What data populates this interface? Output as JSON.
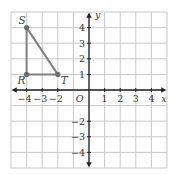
{
  "diagram": {
    "type": "coordinate-grid",
    "x_range": [
      -5,
      5
    ],
    "y_range": [
      -5,
      5
    ],
    "axes": {
      "x_label": "x",
      "y_label": "y",
      "origin_label": "O",
      "x_ticks": [
        {
          "value": -4,
          "label": "−4"
        },
        {
          "value": -3,
          "label": "−3"
        },
        {
          "value": -2,
          "label": "−2"
        },
        {
          "value": 1,
          "label": "1"
        },
        {
          "value": 2,
          "label": "2"
        },
        {
          "value": 3,
          "label": "3"
        },
        {
          "value": 4,
          "label": "4"
        }
      ],
      "y_ticks": [
        {
          "value": 4,
          "label": "4"
        },
        {
          "value": 3,
          "label": "3"
        },
        {
          "value": 2,
          "label": "2"
        },
        {
          "value": 1,
          "label": "1"
        },
        {
          "value": -2,
          "label": "−2"
        },
        {
          "value": -3,
          "label": "−3"
        },
        {
          "value": -4,
          "label": "−4"
        }
      ]
    },
    "triangle": {
      "vertices": [
        {
          "name": "S",
          "x": -4,
          "y": 4
        },
        {
          "name": "R",
          "x": -4,
          "y": 1
        },
        {
          "name": "T",
          "x": -2,
          "y": 1
        }
      ]
    },
    "colors": {
      "grid": "#c8c8c8",
      "axis": "#222222",
      "shape": "#808080",
      "point": "#6e6e6e"
    }
  }
}
